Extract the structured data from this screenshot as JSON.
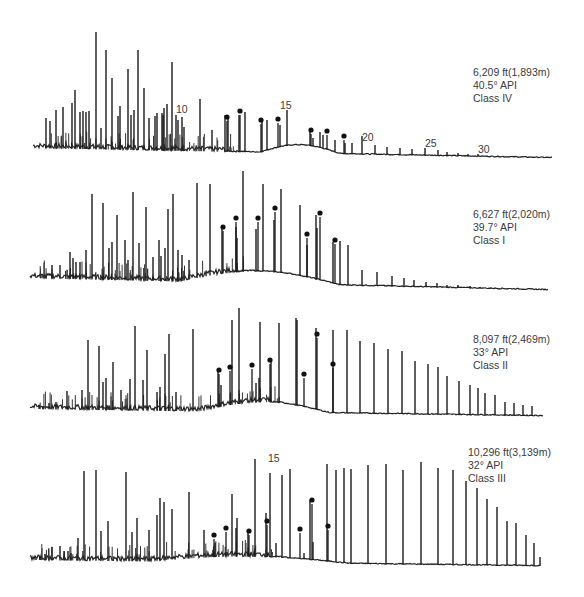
{
  "chart_data": [
    {
      "type": "line",
      "title": "Gas chromatogram - Class IV",
      "depth": "6,209 ft(1,893m)",
      "api": "40.5° API",
      "class": "Class IV",
      "label_pos": [
        473,
        66
      ],
      "baseline": {
        "x0": 33,
        "y0": 148,
        "x1": 552,
        "y1": 158,
        "hump_start": 260,
        "hump_end": 340,
        "hump_height": 8
      },
      "peak_numbers": [
        {
          "label": "10",
          "x": 176,
          "y": 113
        },
        {
          "label": "15",
          "x": 280,
          "y": 109
        },
        {
          "label": "20",
          "x": 362,
          "y": 141
        },
        {
          "label": "25",
          "x": 425,
          "y": 147
        },
        {
          "label": "30",
          "x": 478,
          "y": 153
        }
      ],
      "peaks": [
        [
          46,
          118
        ],
        [
          50,
          121
        ],
        [
          56,
          110
        ],
        [
          63,
          107
        ],
        [
          72,
          103
        ],
        [
          75,
          90
        ],
        [
          80,
          112
        ],
        [
          83,
          111
        ],
        [
          86,
          112
        ],
        [
          89,
          111
        ],
        [
          96,
          32
        ],
        [
          101,
          128
        ],
        [
          106,
          50
        ],
        [
          112,
          78
        ],
        [
          118,
          116
        ],
        [
          120,
          106
        ],
        [
          128,
          69
        ],
        [
          131,
          115
        ],
        [
          134,
          110
        ],
        [
          138,
          50
        ],
        [
          144,
          88
        ],
        [
          149,
          118
        ],
        [
          155,
          116
        ],
        [
          157,
          113
        ],
        [
          162,
          113
        ],
        [
          163,
          115
        ],
        [
          164,
          108
        ],
        [
          167,
          104
        ],
        [
          172,
          62
        ],
        [
          176,
          115
        ],
        [
          178,
          120
        ],
        [
          182,
          117
        ],
        [
          184,
          127
        ],
        [
          200,
          99
        ],
        [
          212,
          130
        ],
        [
          225,
          115
        ],
        [
          228,
          118
        ],
        [
          239,
          115
        ],
        [
          245,
          112
        ],
        [
          262,
          118
        ],
        [
          267,
          120
        ],
        [
          280,
          125
        ],
        [
          287,
          110
        ],
        [
          310,
          130
        ],
        [
          313,
          138
        ],
        [
          320,
          132
        ],
        [
          323,
          135
        ],
        [
          335,
          140
        ],
        [
          345,
          143
        ],
        [
          352,
          143
        ],
        [
          362,
          136
        ],
        [
          375,
          145
        ],
        [
          387,
          147
        ],
        [
          400,
          148
        ],
        [
          412,
          149
        ],
        [
          425,
          148
        ],
        [
          438,
          150
        ],
        [
          447,
          152
        ],
        [
          458,
          153
        ],
        [
          468,
          154
        ],
        [
          478,
          154
        ],
        [
          488,
          156
        ],
        [
          500,
          156
        ],
        [
          512,
          157
        ]
      ],
      "markers": [
        [
          227,
          118
        ],
        [
          240,
          112
        ],
        [
          261,
          121
        ],
        [
          278,
          120
        ],
        [
          311,
          131
        ],
        [
          327,
          132
        ],
        [
          344,
          137
        ]
      ]
    },
    {
      "type": "line",
      "title": "Gas chromatogram - Class I",
      "depth": "6,627 ft(2,020m)",
      "api": "39.7° API",
      "class": "Class I",
      "label_pos": [
        473,
        208
      ],
      "baseline": {
        "x0": 30,
        "y0": 278,
        "x1": 548,
        "y1": 290,
        "hump_start": 180,
        "hump_end": 340,
        "hump_height": 12
      },
      "peak_numbers": [],
      "peaks": [
        [
          42,
          274
        ],
        [
          46,
          276
        ],
        [
          52,
          265
        ],
        [
          60,
          265
        ],
        [
          70,
          252
        ],
        [
          73,
          258
        ],
        [
          76,
          262
        ],
        [
          80,
          262
        ],
        [
          86,
          250
        ],
        [
          92,
          194
        ],
        [
          103,
          203
        ],
        [
          109,
          248
        ],
        [
          112,
          242
        ],
        [
          117,
          215
        ],
        [
          125,
          240
        ],
        [
          128,
          260
        ],
        [
          133,
          192
        ],
        [
          139,
          243
        ],
        [
          146,
          207
        ],
        [
          153,
          257
        ],
        [
          159,
          240
        ],
        [
          161,
          256
        ],
        [
          165,
          248
        ],
        [
          168,
          209
        ],
        [
          173,
          194
        ],
        [
          178,
          250
        ],
        [
          182,
          255
        ],
        [
          189,
          260
        ],
        [
          197,
          183
        ],
        [
          210,
          184
        ],
        [
          222,
          225
        ],
        [
          236,
          227
        ],
        [
          237,
          238
        ],
        [
          243,
          171
        ],
        [
          256,
          229
        ],
        [
          263,
          184
        ],
        [
          274,
          220
        ],
        [
          281,
          189
        ],
        [
          300,
          205
        ],
        [
          307,
          245
        ],
        [
          317,
          228
        ],
        [
          316,
          215
        ],
        [
          333,
          242
        ],
        [
          340,
          241
        ],
        [
          348,
          245
        ],
        [
          362,
          270
        ],
        [
          377,
          272
        ],
        [
          392,
          276
        ],
        [
          404,
          278
        ],
        [
          414,
          280
        ],
        [
          426,
          282
        ],
        [
          437,
          283
        ],
        [
          447,
          285
        ],
        [
          458,
          285
        ],
        [
          470,
          286
        ],
        [
          480,
          287
        ],
        [
          490,
          288
        ]
      ],
      "markers": [
        [
          223,
          228
        ],
        [
          236,
          219
        ],
        [
          258,
          219
        ],
        [
          275,
          209
        ],
        [
          307,
          235
        ],
        [
          320,
          214
        ],
        [
          335,
          241
        ]
      ]
    },
    {
      "type": "line",
      "title": "Gas chromatogram - Class II",
      "depth": "8,097 ft(2,469m)",
      "api": "33° API",
      "class": "Class II",
      "label_pos": [
        473,
        345
      ],
      "baseline": {
        "x0": 30,
        "y0": 409,
        "x1": 543,
        "y1": 416,
        "hump_start": 200,
        "hump_end": 330,
        "hump_height": 10
      },
      "peak_numbers": [],
      "peaks": [
        [
          39,
          405
        ],
        [
          43,
          406
        ],
        [
          49,
          403
        ],
        [
          56,
          402
        ],
        [
          67,
          391
        ],
        [
          82,
          390
        ],
        [
          88,
          340
        ],
        [
          99,
          346
        ],
        [
          103,
          382
        ],
        [
          106,
          378
        ],
        [
          113,
          362
        ],
        [
          121,
          390
        ],
        [
          130,
          379
        ],
        [
          135,
          326
        ],
        [
          143,
          380
        ],
        [
          147,
          350
        ],
        [
          157,
          392
        ],
        [
          160,
          387
        ],
        [
          165,
          354
        ],
        [
          169,
          334
        ],
        [
          176,
          392
        ],
        [
          193,
          329
        ],
        [
          218,
          372
        ],
        [
          221,
          385
        ],
        [
          232,
          320
        ],
        [
          239,
          308
        ],
        [
          256,
          383
        ],
        [
          259,
          378
        ],
        [
          260,
          322
        ],
        [
          271,
          362
        ],
        [
          279,
          323
        ],
        [
          297,
          320
        ],
        [
          296,
          318
        ],
        [
          316,
          328
        ],
        [
          333,
          330
        ],
        [
          347,
          330
        ],
        [
          360,
          341
        ],
        [
          374,
          343
        ],
        [
          388,
          349
        ],
        [
          402,
          351
        ],
        [
          415,
          361
        ],
        [
          428,
          364
        ],
        [
          438,
          367
        ],
        [
          447,
          376
        ],
        [
          459,
          381
        ],
        [
          470,
          385
        ],
        [
          478,
          388
        ],
        [
          485,
          393
        ],
        [
          495,
          395
        ],
        [
          505,
          402
        ],
        [
          514,
          403
        ],
        [
          523,
          405
        ],
        [
          532,
          406
        ]
      ],
      "markers": [
        [
          219,
          371
        ],
        [
          230,
          368
        ],
        [
          252,
          366
        ],
        [
          270,
          361
        ],
        [
          304,
          375
        ],
        [
          317,
          335
        ],
        [
          333,
          365
        ]
      ]
    },
    {
      "type": "line",
      "title": "Gas chromatogram - Class III",
      "depth": "10,296 ft(3,139m)",
      "api": "32° API",
      "class": "Class III",
      "label_pos": [
        468,
        446
      ],
      "baseline": {
        "x0": 30,
        "y0": 560,
        "x1": 540,
        "y1": 566,
        "hump_start": 150,
        "hump_end": 350,
        "hump_height": 6
      },
      "peak_numbers": [
        {
          "label": "15",
          "x": 268,
          "y": 462
        }
      ],
      "peaks": [
        [
          36,
          557
        ],
        [
          40,
          556
        ],
        [
          45,
          554
        ],
        [
          52,
          547
        ],
        [
          60,
          546
        ],
        [
          64,
          551
        ],
        [
          68,
          551
        ],
        [
          71,
          553
        ],
        [
          78,
          538
        ],
        [
          84,
          471
        ],
        [
          96,
          470
        ],
        [
          101,
          531
        ],
        [
          108,
          521
        ],
        [
          126,
          472
        ],
        [
          132,
          532
        ],
        [
          137,
          518
        ],
        [
          149,
          530
        ],
        [
          157,
          515
        ],
        [
          160,
          498
        ],
        [
          164,
          502
        ],
        [
          172,
          509
        ],
        [
          189,
          492
        ],
        [
          204,
          530
        ],
        [
          213,
          550
        ],
        [
          215,
          543
        ],
        [
          232,
          494
        ],
        [
          236,
          528
        ],
        [
          237,
          518
        ],
        [
          248,
          532
        ],
        [
          255,
          459
        ],
        [
          266,
          513
        ],
        [
          270,
          473
        ],
        [
          276,
          543
        ],
        [
          282,
          475
        ],
        [
          290,
          469
        ],
        [
          304,
          553
        ],
        [
          310,
          500
        ],
        [
          313,
          542
        ],
        [
          327,
          464
        ],
        [
          336,
          470
        ],
        [
          344,
          468
        ],
        [
          351,
          469
        ],
        [
          368,
          465
        ],
        [
          386,
          464
        ],
        [
          403,
          470
        ],
        [
          421,
          462
        ],
        [
          438,
          468
        ],
        [
          453,
          470
        ],
        [
          466,
          481
        ],
        [
          477,
          488
        ],
        [
          487,
          499
        ],
        [
          497,
          507
        ],
        [
          507,
          521
        ],
        [
          516,
          523
        ],
        [
          526,
          535
        ],
        [
          534,
          543
        ],
        [
          540,
          557
        ]
      ],
      "markers": [
        [
          214,
          536
        ],
        [
          226,
          529
        ],
        [
          249,
          532
        ],
        [
          267,
          522
        ],
        [
          300,
          530
        ],
        [
          312,
          501
        ],
        [
          328,
          527
        ]
      ]
    }
  ]
}
